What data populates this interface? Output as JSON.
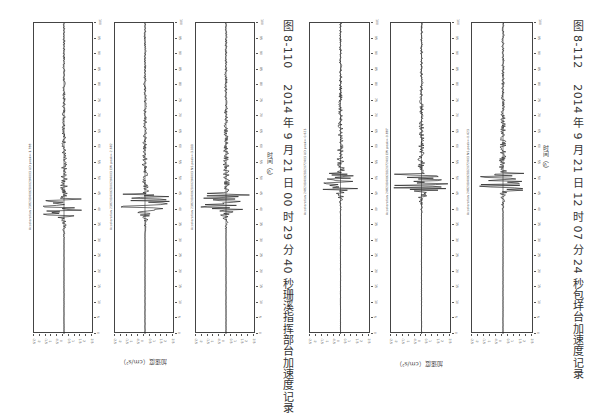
{
  "figures": [
    {
      "id": "fig-8-110",
      "caption_number": "图 8-110",
      "caption_text": "2014 年 9 月 21 日 00 时 29 分 40 秒珊溪指挥部台加速度记录",
      "time_axis_title": "时间（s）",
      "accel_axis_title": "加速度（cm/s²）",
      "panels": [
        {
          "label": "Acceleration 2382014092100294003 UD  peak=-1.788",
          "peak": -1.788,
          "burst_center": 185,
          "burst_amp": 22
        },
        {
          "label": "Acceleration 2382014092100294003 EW  peak=-2.682",
          "peak": -2.682,
          "burst_center": 180,
          "burst_amp": 26
        },
        {
          "label": "Acceleration 2382014092100294003 NS  peak=-3.111",
          "peak": -3.111,
          "burst_center": 180,
          "burst_amp": 26
        }
      ]
    },
    {
      "id": "fig-8-112",
      "caption_number": "图 8-112",
      "caption_text": "2014 年 9 月 21 日 12 时 07 分 24 秒包垟台加速度记录",
      "time_axis_title": "时间（s）",
      "accel_axis_title": "加速度（cm/s²）",
      "panels": [
        {
          "label": "Acceleration 2482014092112072403 UD  peak=-0.623",
          "peak": -0.623,
          "burst_center": 160,
          "burst_amp": 18
        },
        {
          "label": "Acceleration 2482014092112072403 EW  peak=-0.887",
          "peak": -0.887,
          "burst_center": 160,
          "burst_amp": 28
        },
        {
          "label": "Acceleration 2482014092112072403 NS  peak=-0.423",
          "peak": -0.423,
          "burst_center": 160,
          "burst_amp": 25
        }
      ]
    }
  ],
  "time_ticks": [
    "0",
    "5",
    "10",
    "15",
    "20",
    "25",
    "30",
    "35",
    "40",
    "45",
    "50",
    "55",
    "60",
    "65",
    "70",
    "75",
    "80",
    "85",
    "90",
    "95",
    "100"
  ],
  "accel_ticks": [
    "-2.5",
    "-2",
    "-1.5",
    "-1",
    "-0.5",
    "0",
    "0.5",
    "1",
    "1.5",
    "2",
    "2.5"
  ]
}
